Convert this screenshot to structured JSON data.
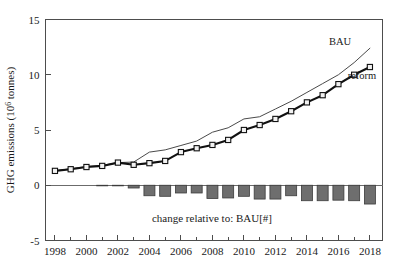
{
  "chart_data": {
    "type": "line",
    "title": "",
    "xlabel": "",
    "ylabel": "GHG emissions (10⁶ tonnes)",
    "ylabel_main": "GHG emissions (10",
    "ylabel_exp": "6",
    "ylabel_tail": " tonnes)",
    "xlim": [
      1997.4,
      2018.8
    ],
    "ylim": [
      -5,
      15
    ],
    "grid": false,
    "legend_position": "inline-right",
    "y_ticks": [
      -5,
      0,
      5,
      10,
      15
    ],
    "y_tick_labels": [
      "-5",
      "0",
      "5",
      "10",
      "15"
    ],
    "x_ticks_major": [
      1998,
      2000,
      2002,
      2004,
      2006,
      2008,
      2010,
      2012,
      2014,
      2016,
      2018
    ],
    "x_tick_labels": [
      "1998",
      "2000",
      "2002",
      "2004",
      "2006",
      "2008",
      "2010",
      "2012",
      "2014",
      "2016",
      "2018"
    ],
    "x_ticks_minor": [
      1999,
      2001,
      2003,
      2005,
      2007,
      2009,
      2011,
      2013,
      2015,
      2017
    ],
    "x": [
      1998,
      1999,
      2000,
      2001,
      2002,
      2003,
      2004,
      2005,
      2006,
      2007,
      2008,
      2009,
      2010,
      2011,
      2012,
      2013,
      2014,
      2015,
      2016,
      2017,
      2018
    ],
    "series": [
      {
        "name": "BAU",
        "label": "BAU",
        "marker": "none",
        "style": "thin-line",
        "color": "#4a4a4a",
        "values": [
          1.3,
          1.5,
          1.7,
          1.8,
          2.05,
          2.1,
          3.0,
          3.2,
          3.6,
          4.0,
          4.8,
          5.2,
          6.0,
          6.2,
          6.9,
          7.6,
          8.4,
          9.2,
          10.0,
          11.1,
          12.4
        ]
      },
      {
        "name": "reform",
        "label": "reform",
        "marker": "square",
        "style": "thick-line",
        "color": "#111111",
        "values": [
          1.3,
          1.45,
          1.65,
          1.75,
          2.05,
          1.85,
          2.0,
          2.2,
          3.0,
          3.35,
          3.65,
          4.1,
          5.0,
          5.45,
          6.0,
          6.7,
          7.5,
          8.15,
          9.15,
          10.0,
          10.7
        ]
      }
    ],
    "bars": {
      "name": "change relative to: BAU[#]",
      "label": "change relative to: BAU[#]",
      "color": "#6e6e6e",
      "values": [
        0,
        0,
        0,
        -0.05,
        -0.05,
        -0.25,
        -0.95,
        -1.0,
        -0.7,
        -0.7,
        -1.2,
        -1.15,
        -1.0,
        -1.25,
        -1.25,
        -0.95,
        -1.4,
        -1.4,
        -1.35,
        -1.4,
        -1.7
      ]
    },
    "annotations": [
      {
        "text": "BAU",
        "x": 2016.2,
        "y": 13.1
      },
      {
        "text": "reform",
        "x": 2017.6,
        "y": 10.0
      },
      {
        "text": "change relative to: BAU[#]",
        "x": 2008.0,
        "y": -3.05
      }
    ]
  }
}
